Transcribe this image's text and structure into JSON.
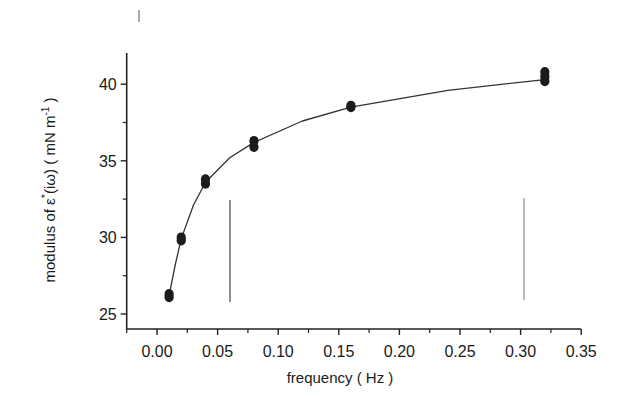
{
  "chart_data": {
    "type": "scatter",
    "title": "",
    "xlabel": "frequency ( Hz )",
    "ylabel": "modulus of ε*(iω) ( mN m⁻¹ )",
    "xlim": [
      -0.025,
      0.35
    ],
    "ylim": [
      24,
      42
    ],
    "x_ticks": [
      "0.00",
      "0.05",
      "0.10",
      "0.15",
      "0.20",
      "0.25",
      "0.30",
      "0.35"
    ],
    "y_ticks": [
      "25",
      "30",
      "35",
      "40"
    ],
    "grid": false,
    "legend": null,
    "series": [
      {
        "name": "measurements",
        "marker": "filled-circle",
        "points": [
          {
            "x": 0.01,
            "y": 26.1
          },
          {
            "x": 0.01,
            "y": 26.3
          },
          {
            "x": 0.02,
            "y": 29.8
          },
          {
            "x": 0.02,
            "y": 30.0
          },
          {
            "x": 0.04,
            "y": 33.5
          },
          {
            "x": 0.04,
            "y": 33.8
          },
          {
            "x": 0.08,
            "y": 35.9
          },
          {
            "x": 0.08,
            "y": 36.3
          },
          {
            "x": 0.16,
            "y": 38.5
          },
          {
            "x": 0.16,
            "y": 38.6
          },
          {
            "x": 0.32,
            "y": 40.2
          },
          {
            "x": 0.32,
            "y": 40.5
          },
          {
            "x": 0.32,
            "y": 40.8
          }
        ]
      },
      {
        "name": "fit",
        "type": "line",
        "x": [
          0.01,
          0.015,
          0.02,
          0.03,
          0.04,
          0.06,
          0.08,
          0.12,
          0.16,
          0.24,
          0.32
        ],
        "y": [
          26.2,
          28.2,
          29.9,
          32.1,
          33.6,
          35.2,
          36.2,
          37.6,
          38.5,
          39.6,
          40.3
        ]
      }
    ]
  },
  "labels": {
    "xlabel": "frequency ( Hz )",
    "ylabel_main": "modulus of ε",
    "ylabel_sup_star": "*",
    "ylabel_arg": "(iω) ( mN m",
    "ylabel_sup": "-1",
    "ylabel_close": " )"
  }
}
